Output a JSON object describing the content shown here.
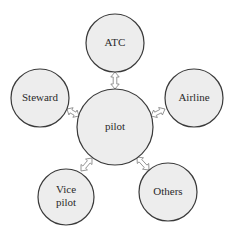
{
  "diagram": {
    "type": "hub-and-spoke",
    "colors": {
      "node_fill": "#ededed",
      "node_stroke": "#3a3a3a",
      "arrow_fill": "#ffffff",
      "arrow_stroke": "#8a8a8a",
      "text": "#2a2a2a"
    },
    "center": {
      "id": "pilot",
      "label": "pilot",
      "cx": 115,
      "cy": 127,
      "r": 38
    },
    "nodes": [
      {
        "id": "atc",
        "lines": [
          "ATC"
        ],
        "cx": 115,
        "cy": 43,
        "r": 29
      },
      {
        "id": "steward",
        "lines": [
          "Steward"
        ],
        "cx": 40,
        "cy": 98,
        "r": 29
      },
      {
        "id": "airline",
        "lines": [
          "Airline"
        ],
        "cx": 194,
        "cy": 98,
        "r": 29
      },
      {
        "id": "vice-pilot",
        "lines": [
          "Vice",
          "pilot"
        ],
        "cx": 66,
        "cy": 197,
        "r": 28
      },
      {
        "id": "others",
        "lines": [
          "Others"
        ],
        "cx": 168,
        "cy": 192,
        "r": 29
      }
    ],
    "edges": [
      {
        "from": "pilot",
        "to": "atc",
        "x1": 115,
        "y1": 89,
        "x2": 115,
        "y2": 72,
        "bidirectional": true
      },
      {
        "from": "pilot",
        "to": "steward",
        "x1": 79,
        "y1": 116,
        "x2": 67,
        "y2": 109,
        "bidirectional": true
      },
      {
        "from": "pilot",
        "to": "airline",
        "x1": 151,
        "y1": 116,
        "x2": 165,
        "y2": 109,
        "bidirectional": true
      },
      {
        "from": "pilot",
        "to": "vice-pilot",
        "x1": 92,
        "y1": 158,
        "x2": 81,
        "y2": 171,
        "bidirectional": true
      },
      {
        "from": "pilot",
        "to": "others",
        "x1": 137,
        "y1": 157,
        "x2": 149,
        "y2": 170,
        "bidirectional": true
      }
    ]
  }
}
